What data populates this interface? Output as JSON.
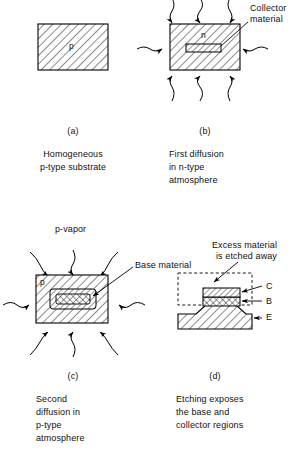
{
  "figure": {
    "title_letters": {
      "a": "(a)",
      "b": "(b)",
      "c": "(c)",
      "d": "(d)"
    },
    "panels": [
      {
        "id": "a",
        "letter": "(a)",
        "caption_lines": [
          "Homogeneous",
          "p-type substrate"
        ],
        "region_labels": [
          "p"
        ]
      },
      {
        "id": "b",
        "letter": "(b)",
        "caption_lines": [
          "First diffusion",
          "in n-type",
          "atmosphere"
        ],
        "region_labels": [
          "n"
        ],
        "callouts": [
          "Collector",
          "material"
        ]
      },
      {
        "id": "c",
        "letter": "(c)",
        "caption_lines": [
          "Second",
          "diffusion in",
          "p-type",
          "atmosphere"
        ],
        "region_labels": [
          "p"
        ],
        "callouts": [
          "Base material"
        ],
        "vapor_label": "p-vapor"
      },
      {
        "id": "d",
        "letter": "(d)",
        "caption_lines": [
          "Etching exposes",
          "the base and",
          "collector regions"
        ],
        "callouts": [
          "Excess material",
          "is etched away"
        ],
        "terminal_labels": [
          "C",
          "B",
          "E"
        ]
      }
    ],
    "annotations": {
      "collector_material_line1": "Collector",
      "collector_material_line2": "material",
      "base_material": "Base material",
      "excess_line1": "Excess material",
      "excess_line2": "is etched away",
      "p_vapor": "p-vapor",
      "label_p_a": "p",
      "label_n_b": "n",
      "label_p_c": "p",
      "terminal_c": "C",
      "terminal_b": "B",
      "terminal_e": "E"
    },
    "captions": {
      "a_letter": "(a)",
      "a_line1": "Homogeneous",
      "a_line2": "p-type substrate",
      "b_letter": "(b)",
      "b_line1": "First diffusion",
      "b_line2": "in n-type",
      "b_line3": "atmosphere",
      "c_letter": "(c)",
      "c_line1": "Second",
      "c_line2": "diffusion in",
      "c_line3": "p-type",
      "c_line4": "atmosphere",
      "d_letter": "(d)",
      "d_line1": "Etching exposes",
      "d_line2": "the base and",
      "d_line3": "collector regions"
    },
    "colors": {
      "ink": "#000000",
      "background": "#ffffff"
    }
  }
}
